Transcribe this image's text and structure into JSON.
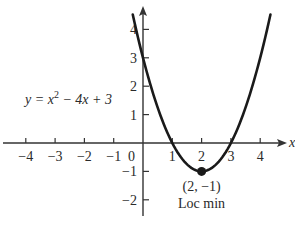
{
  "chart_data": {
    "type": "line",
    "title": "",
    "equation_label": {
      "prefix": "y = x",
      "sup": "2",
      "suffix": " − 4x + 3"
    },
    "function": "y = x^2 - 4x + 3",
    "xlabel": "x",
    "ylabel": "y",
    "xlim": [
      -4.3,
      4.6
    ],
    "ylim": [
      -2.5,
      4.8
    ],
    "x_ticks": [
      -4,
      -3,
      -2,
      -1,
      1,
      2,
      3,
      4
    ],
    "x_tick_labels": [
      "−4",
      "−3",
      "−2",
      "−1",
      "1",
      "2",
      "3",
      "4"
    ],
    "origin_label": "0",
    "y_ticks": [
      4,
      3,
      2,
      1,
      -1,
      -2
    ],
    "y_tick_labels": [
      "4",
      "3",
      "2",
      "1",
      "−1",
      "−2"
    ],
    "series": [
      {
        "name": "y = x^2 - 4x + 3",
        "x": [
          -0.35,
          0,
          0.5,
          1,
          1.5,
          2,
          2.5,
          3,
          3.5,
          4,
          4.35
        ],
        "y": [
          4.5,
          3,
          1.25,
          0,
          -0.75,
          -1,
          -0.75,
          0,
          1.25,
          3,
          4.5
        ]
      }
    ],
    "annotations": [
      {
        "type": "point",
        "x": 2,
        "y": -1,
        "label": "(2, −1)",
        "sublabel": "Loc min"
      }
    ],
    "grid": false,
    "legend": null
  },
  "colors": {
    "curve": "#1a1a1a",
    "axis": "#333333",
    "text": "#2a2a2a",
    "background": "#ffffff"
  }
}
